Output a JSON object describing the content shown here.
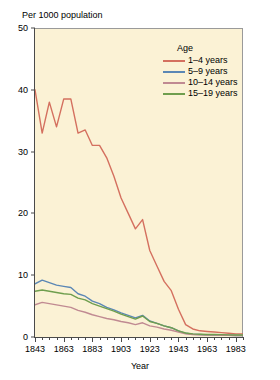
{
  "chart_data": {
    "type": "line",
    "title": "",
    "ylabel": "Per 1000 population",
    "xlabel": "Year",
    "xlim": [
      1843,
      1988
    ],
    "ylim": [
      0,
      50
    ],
    "yticks": [
      0,
      10,
      20,
      30,
      40,
      50
    ],
    "xticks": [
      1843,
      1863,
      1883,
      1903,
      1923,
      1943,
      1963,
      1983
    ],
    "xtick_minor_step": 5,
    "grid": false,
    "legend_title": "Age",
    "legend_position": "top-right-inside",
    "series": [
      {
        "name": "1–4 years",
        "color": "#d4705f",
        "x": [
          1843,
          1848,
          1853,
          1858,
          1863,
          1868,
          1873,
          1878,
          1883,
          1888,
          1893,
          1898,
          1903,
          1908,
          1913,
          1918,
          1923,
          1928,
          1933,
          1938,
          1943,
          1948,
          1953,
          1958,
          1963,
          1968,
          1973,
          1978,
          1983,
          1988
        ],
        "values": [
          40.0,
          33.0,
          38.0,
          34.0,
          38.5,
          38.5,
          33.0,
          33.5,
          31.0,
          31.0,
          29.0,
          26.0,
          22.5,
          20.0,
          17.5,
          19.0,
          14.0,
          11.5,
          9.0,
          7.5,
          4.5,
          2.0,
          1.3,
          1.0,
          0.9,
          0.8,
          0.7,
          0.6,
          0.5,
          0.5
        ]
      },
      {
        "name": "5–9 years",
        "color": "#5b87b5",
        "x": [
          1843,
          1848,
          1853,
          1858,
          1863,
          1868,
          1873,
          1878,
          1883,
          1888,
          1893,
          1898,
          1903,
          1908,
          1913,
          1918,
          1923,
          1928,
          1933,
          1938,
          1943,
          1948,
          1953,
          1958,
          1963,
          1968,
          1973,
          1978,
          1983,
          1988
        ],
        "values": [
          8.6,
          9.2,
          8.8,
          8.4,
          8.2,
          8.0,
          7.0,
          6.6,
          5.8,
          5.4,
          4.8,
          4.4,
          3.9,
          3.5,
          3.1,
          3.5,
          2.6,
          2.2,
          1.8,
          1.5,
          1.0,
          0.6,
          0.45,
          0.4,
          0.35,
          0.33,
          0.3,
          0.28,
          0.25,
          0.25
        ]
      },
      {
        "name": "10–14 years",
        "color": "#c08a92",
        "x": [
          1843,
          1848,
          1853,
          1858,
          1863,
          1868,
          1873,
          1878,
          1883,
          1888,
          1893,
          1898,
          1903,
          1908,
          1913,
          1918,
          1923,
          1928,
          1933,
          1938,
          1943,
          1948,
          1953,
          1958,
          1963,
          1968,
          1973,
          1978,
          1983,
          1988
        ],
        "values": [
          5.2,
          5.6,
          5.4,
          5.2,
          5.0,
          4.8,
          4.3,
          4.0,
          3.6,
          3.3,
          3.0,
          2.8,
          2.5,
          2.3,
          2.0,
          2.3,
          1.8,
          1.6,
          1.3,
          1.1,
          0.8,
          0.5,
          0.4,
          0.35,
          0.3,
          0.3,
          0.28,
          0.26,
          0.25,
          0.25
        ]
      },
      {
        "name": "15–19 years",
        "color": "#6f9e4e",
        "x": [
          1843,
          1848,
          1853,
          1858,
          1863,
          1868,
          1873,
          1878,
          1883,
          1888,
          1893,
          1898,
          1903,
          1908,
          1913,
          1918,
          1923,
          1928,
          1933,
          1938,
          1943,
          1948,
          1953,
          1958,
          1963,
          1968,
          1973,
          1978,
          1983,
          1988
        ],
        "values": [
          7.4,
          7.6,
          7.4,
          7.2,
          7.0,
          6.9,
          6.3,
          6.0,
          5.4,
          5.0,
          4.6,
          4.2,
          3.7,
          3.3,
          2.9,
          3.4,
          2.5,
          2.2,
          1.8,
          1.5,
          1.0,
          0.65,
          0.5,
          0.45,
          0.4,
          0.4,
          0.38,
          0.35,
          0.33,
          0.33
        ]
      }
    ]
  },
  "style": {
    "plot_background": "#fbf2d5",
    "page_background": "#ffffff",
    "axis_color": "#4a4a4a"
  }
}
